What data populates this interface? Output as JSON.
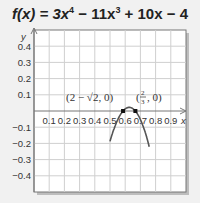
{
  "title": {
    "fx": "f(x) = 3x",
    "e4": "4",
    "mid": " − 11x",
    "e3": "3",
    "tail": " + 10x − 4"
  },
  "chart_data": {
    "type": "line",
    "xlabel": "x",
    "ylabel": "y",
    "xlim": [
      0,
      1.0
    ],
    "ylim": [
      -0.5,
      0.5
    ],
    "grid": true,
    "x_ticks": [
      "0.1",
      "0.2",
      "0.3",
      "0.4",
      "0.5",
      "0.6",
      "0.7",
      "0.8",
      "0.9"
    ],
    "y_ticks": [
      "0.4",
      "0.3",
      "0.2",
      "0.1",
      "−0.1",
      "−0.2",
      "−0.3",
      "−0.4"
    ],
    "points": [
      {
        "label": "(2 − √2, 0)",
        "x": 0.586,
        "y": 0
      },
      {
        "label": "(2/3, 0)",
        "x": 0.667,
        "y": 0
      }
    ],
    "curve_color": "#555555"
  },
  "labels": {
    "y_axis": "y",
    "x_axis": "x",
    "pt1": "(2 − √2, 0)",
    "pt2_open": "(",
    "pt2_num": "2",
    "pt2_den": "3",
    "pt2_close": ", 0)"
  }
}
